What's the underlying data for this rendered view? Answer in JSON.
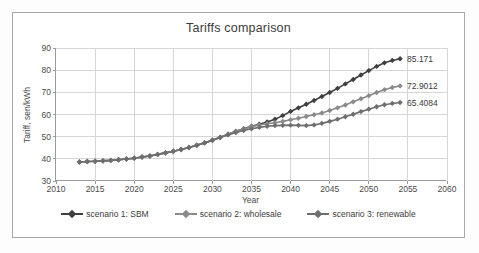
{
  "chart_data": {
    "type": "line",
    "title": "Tariffs comparison",
    "xlabel": "Year",
    "ylabel": "Tariff, sen/kWh",
    "xlim": [
      2010,
      2060
    ],
    "ylim": [
      30,
      90
    ],
    "xticks": [
      2010,
      2015,
      2020,
      2025,
      2030,
      2035,
      2040,
      2045,
      2050,
      2055,
      2060
    ],
    "yticks": [
      30,
      40,
      50,
      60,
      70,
      80,
      90
    ],
    "grid": true,
    "legend_position": "bottom",
    "x": [
      2013,
      2014,
      2015,
      2016,
      2017,
      2018,
      2019,
      2020,
      2021,
      2022,
      2023,
      2024,
      2025,
      2026,
      2027,
      2028,
      2029,
      2030,
      2031,
      2032,
      2033,
      2034,
      2035,
      2036,
      2037,
      2038,
      2039,
      2040,
      2041,
      2042,
      2043,
      2044,
      2045,
      2046,
      2047,
      2048,
      2049,
      2050,
      2051,
      2052,
      2053,
      2054
    ],
    "series": [
      {
        "name": "scenario 1: SBM",
        "color": "#3f3f3f",
        "end_label": "85.171",
        "values": [
          38.6,
          38.8,
          38.9,
          39.1,
          39.3,
          39.6,
          39.9,
          40.3,
          40.8,
          41.3,
          42.0,
          42.7,
          43.4,
          44.2,
          45.1,
          46.1,
          47.2,
          48.4,
          49.7,
          51.1,
          52.4,
          53.6,
          54.7,
          55.6,
          56.6,
          57.9,
          59.5,
          61.4,
          63.0,
          64.6,
          66.3,
          68.1,
          69.9,
          71.8,
          73.8,
          75.8,
          77.8,
          79.8,
          81.7,
          83.3,
          84.4,
          85.171
        ]
      },
      {
        "name": "scenario 2: wholesale",
        "color": "#8a8a8a",
        "end_label": "72.9012",
        "values": [
          38.6,
          38.8,
          38.9,
          39.1,
          39.3,
          39.6,
          39.9,
          40.3,
          40.8,
          41.3,
          42.0,
          42.7,
          43.4,
          44.2,
          45.1,
          46.1,
          47.2,
          48.4,
          49.7,
          51.1,
          52.4,
          53.5,
          54.5,
          55.3,
          55.8,
          56.3,
          56.9,
          57.6,
          58.3,
          59.1,
          59.9,
          60.7,
          61.8,
          63.0,
          64.3,
          65.7,
          67.1,
          68.5,
          69.9,
          71.2,
          72.2,
          72.9012
        ]
      },
      {
        "name": "scenario 3: renewable",
        "color": "#6e6e6e",
        "end_label": "65.4084",
        "values": [
          38.6,
          38.8,
          38.9,
          39.1,
          39.3,
          39.6,
          39.9,
          40.3,
          40.8,
          41.3,
          42.0,
          42.7,
          43.4,
          44.2,
          45.1,
          46.1,
          47.2,
          48.4,
          49.6,
          50.8,
          51.9,
          52.8,
          53.6,
          54.2,
          54.7,
          55.0,
          55.1,
          55.2,
          55.1,
          55.0,
          55.3,
          56.0,
          56.9,
          57.9,
          59.0,
          60.1,
          61.3,
          62.4,
          63.5,
          64.4,
          65.0,
          65.4084
        ]
      }
    ]
  }
}
